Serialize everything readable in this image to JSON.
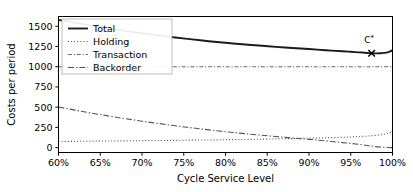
{
  "chart_data": {
    "type": "line",
    "title": "",
    "xlabel": "Cycle Service Level",
    "ylabel": "Costs per period",
    "xlim": [
      60,
      100
    ],
    "ylim": [
      -60,
      1620
    ],
    "grid": false,
    "legend_position": "upper left",
    "x_ticks": [
      60,
      65,
      70,
      75,
      80,
      85,
      90,
      95,
      100
    ],
    "x_tick_labels": [
      "60%",
      "65%",
      "70%",
      "75%",
      "80%",
      "85%",
      "90%",
      "95%",
      "100%"
    ],
    "y_ticks": [
      0,
      250,
      500,
      750,
      1000,
      1250,
      1500
    ],
    "y_tick_labels": [
      "0",
      "250",
      "500",
      "750",
      "1000",
      "1250",
      "1500"
    ],
    "x": [
      60,
      62,
      64,
      66,
      68,
      70,
      72,
      74,
      76,
      78,
      80,
      82,
      84,
      86,
      88,
      90,
      92,
      94,
      95,
      96,
      97,
      97.5,
      98,
      98.5,
      99,
      99.5,
      99.8,
      100
    ],
    "series": [
      {
        "name": "Total",
        "style": "solid",
        "color": "#1a1a1a",
        "width": 1.9,
        "values": [
          1578,
          1541,
          1506,
          1473,
          1442,
          1413,
          1386,
          1360,
          1337,
          1315,
          1295,
          1277,
          1261,
          1245,
          1231,
          1218,
          1204,
          1190,
          1184,
          1177,
          1170,
          1166,
          1165,
          1166,
          1170,
          1180,
          1192,
          1207
        ]
      },
      {
        "name": "Holding",
        "style": "dotted",
        "color": "#4d4d4d",
        "width": 1.1,
        "values": [
          76,
          78,
          80,
          82,
          84,
          86,
          88,
          90,
          93,
          95,
          98,
          101,
          104,
          108,
          112,
          116,
          121,
          128,
          132,
          137,
          143,
          147,
          152,
          158,
          166,
          180,
          195,
          212
        ]
      },
      {
        "name": "Transaction",
        "style": "dashdot-short",
        "color": "#6b6b6b",
        "width": 1.1,
        "values": [
          1000,
          1000,
          1000,
          1000,
          1000,
          1000,
          1000,
          1000,
          1000,
          1000,
          1000,
          1000,
          1000,
          1000,
          1000,
          1000,
          1000,
          1000,
          1000,
          1000,
          1000,
          1000,
          1000,
          1000,
          1000,
          1000,
          1000,
          1000
        ]
      },
      {
        "name": "Backorder",
        "style": "dashdot",
        "color": "#555555",
        "width": 1.1,
        "values": [
          502,
          463,
          426,
          391,
          358,
          327,
          298,
          270,
          244,
          220,
          197,
          176,
          157,
          137,
          119,
          102,
          83,
          62,
          52,
          40,
          27,
          19,
          13,
          8,
          4,
          1,
          0,
          0
        ]
      }
    ],
    "annotations": [
      {
        "name": "optimum-marker",
        "label": "C*",
        "marker": "x",
        "x": 97.5,
        "y": 1166,
        "label_x": 97.2,
        "label_y": 1290
      }
    ]
  },
  "legend": {
    "items": [
      {
        "label": "Total"
      },
      {
        "label": "Holding"
      },
      {
        "label": "Transaction"
      },
      {
        "label": "Backorder"
      }
    ]
  }
}
